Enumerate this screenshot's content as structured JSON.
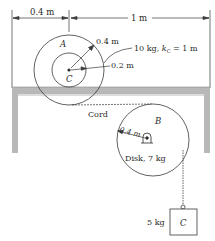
{
  "dimensions": {
    "left_span": "0.4 m",
    "right_span": "1 m"
  },
  "wheel_a": {
    "label": "A",
    "center_label": "C",
    "outer_radius_label": "0.4 m",
    "inner_radius_label": "0.2 m",
    "mass_label": "10 kg, ",
    "gyration_symbol": "k",
    "gyration_sub": "C",
    "gyration_value": " = 1 m"
  },
  "cord": {
    "label": "Cord"
  },
  "disk_b": {
    "label": "B",
    "radius_label": "0.4 m",
    "description": "Disk, 7 kg"
  },
  "block_c": {
    "label": "C",
    "mass_label": "5 kg"
  },
  "colors": {
    "line": "#3a3a3a",
    "support_fill": "#b8b8b8",
    "support_light": "#dcdcdc",
    "background": "#ffffff"
  }
}
